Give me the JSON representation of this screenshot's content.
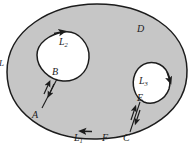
{
  "figure": {
    "kind": "multiply-connected-region-diagram",
    "colors": {
      "background": "#ffffff",
      "region_fill": "#c6c6c6",
      "hole_fill": "#fdfdfd",
      "stroke": "#1c1c1c"
    },
    "labels": {
      "region": "D",
      "outer_contour": "L",
      "outer_contour_sub": "1",
      "hole_left_contour": "L",
      "hole_left_contour_sub": "2",
      "hole_right_contour": "L",
      "hole_right_contour_sub": "3",
      "point_a": "A",
      "point_b": "B",
      "point_c": "C",
      "point_e": "E",
      "point_f": "F",
      "edge_clipped": "L"
    }
  }
}
